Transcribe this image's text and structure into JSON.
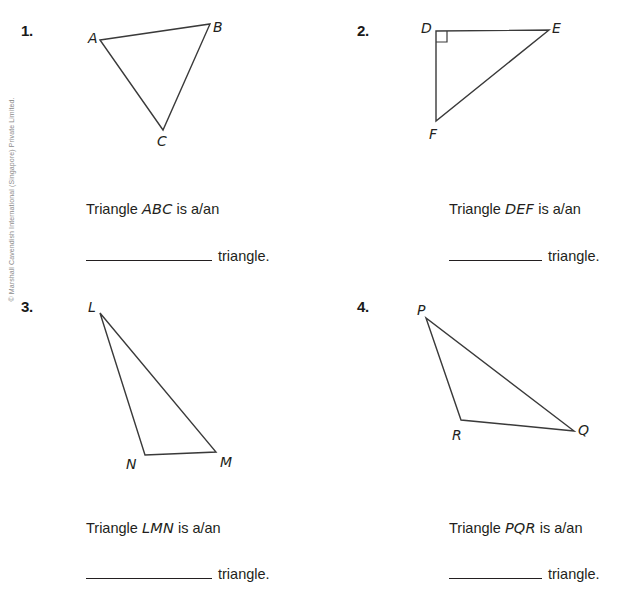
{
  "page": {
    "copyright": "© Marshall Cavendish International (Singapore) Private Limited.",
    "width": 641,
    "height": 604,
    "ink_color": "#231f20",
    "line_color": "#3a3a3a"
  },
  "problems": [
    {
      "number": "1.",
      "figure": {
        "name": "triangle-abc",
        "type": "scalene-triangle",
        "right_angle_at": null,
        "vertices": [
          {
            "label": "A",
            "x": 100,
            "y": 40
          },
          {
            "label": "B",
            "x": 210,
            "y": 24
          },
          {
            "label": "C",
            "x": 163,
            "y": 130
          }
        ],
        "labels": [
          {
            "text": "A",
            "x": 88,
            "y": 31
          },
          {
            "text": "B",
            "x": 213,
            "y": 20
          },
          {
            "text": "C",
            "x": 157,
            "y": 134
          }
        ]
      },
      "prompt_prefix": "Triangle ",
      "prompt_letters": "ABC",
      "prompt_suffix": " is a/an",
      "answer_tail": "triangle."
    },
    {
      "number": "2.",
      "figure": {
        "name": "triangle-def",
        "type": "right-triangle",
        "right_angle_at": "D",
        "vertices": [
          {
            "label": "D",
            "x": 436,
            "y": 31
          },
          {
            "label": "E",
            "x": 549,
            "y": 30
          },
          {
            "label": "F",
            "x": 436,
            "y": 121
          }
        ],
        "labels": [
          {
            "text": "D",
            "x": 421,
            "y": 21
          },
          {
            "text": "E",
            "x": 552,
            "y": 21
          },
          {
            "text": "F",
            "x": 429,
            "y": 127
          }
        ]
      },
      "prompt_prefix": "Triangle ",
      "prompt_letters": "DEF",
      "prompt_suffix": " is a/an",
      "answer_tail": "triangle."
    },
    {
      "number": "3.",
      "figure": {
        "name": "triangle-lmn",
        "type": "scalene-triangle",
        "right_angle_at": null,
        "vertices": [
          {
            "label": "L",
            "x": 100,
            "y": 313
          },
          {
            "label": "N",
            "x": 145,
            "y": 455
          },
          {
            "label": "M",
            "x": 216,
            "y": 452
          }
        ],
        "labels": [
          {
            "text": "L",
            "x": 88,
            "y": 300
          },
          {
            "text": "N",
            "x": 126,
            "y": 457
          },
          {
            "text": "M",
            "x": 220,
            "y": 455
          }
        ]
      },
      "prompt_prefix": "Triangle ",
      "prompt_letters": "LMN",
      "prompt_suffix": " is a/an",
      "answer_tail": "triangle."
    },
    {
      "number": "4.",
      "figure": {
        "name": "triangle-pqr",
        "type": "scalene-triangle",
        "right_angle_at": null,
        "vertices": [
          {
            "label": "P",
            "x": 426,
            "y": 318
          },
          {
            "label": "R",
            "x": 461,
            "y": 420
          },
          {
            "label": "Q",
            "x": 574,
            "y": 431
          }
        ],
        "labels": [
          {
            "text": "P",
            "x": 417,
            "y": 303
          },
          {
            "text": "R",
            "x": 452,
            "y": 428
          },
          {
            "text": "Q",
            "x": 578,
            "y": 423
          }
        ]
      },
      "prompt_prefix": "Triangle ",
      "prompt_letters": "PQR",
      "prompt_suffix": " is a/an",
      "answer_tail": "triangle."
    }
  ]
}
